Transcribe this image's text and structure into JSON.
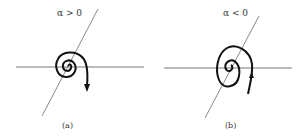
{
  "figure": {
    "panels": [
      {
        "id": "a",
        "condition": "α > 0",
        "caption": "(a)",
        "behavior": "outward spiral",
        "arrow_direction": "down"
      },
      {
        "id": "b",
        "condition": "α < 0",
        "caption": "(b)",
        "behavior": "inward spiral",
        "arrow_direction": "up"
      }
    ],
    "colors": {
      "axis": "#444444",
      "curve": "#111111"
    }
  }
}
